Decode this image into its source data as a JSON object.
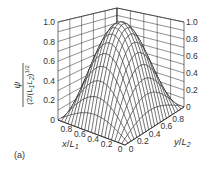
{
  "chart_data": {
    "type": "surface3d",
    "title": "",
    "panel_label": "(a)",
    "function": "psi / (2/(L1 L2))^(1/2) = sin(pi x/L1) * sin(pi y/L2)",
    "zlabel": {
      "main": "ψ",
      "den_prefix": "(2/(L",
      "den_s1": "1",
      "den_mid": "L",
      "den_s2": "2",
      "den_suffix": ")",
      "den_exp": "1/2"
    },
    "xlabel": {
      "var": "x",
      "slash": "/",
      "L": "L",
      "sub": "1"
    },
    "ylabel": {
      "var": "y",
      "slash": "/",
      "L": "L",
      "sub": "2"
    },
    "zlim": [
      0,
      1.0
    ],
    "xlim": [
      0,
      1
    ],
    "ylim": [
      0,
      1
    ],
    "z_ticks": [
      "0",
      "0.2",
      "0.4",
      "0.6",
      "0.8",
      "1.0"
    ],
    "x_ticks": [
      "0",
      "0.2",
      "0.4",
      "0.6",
      "0.8"
    ],
    "y_ticks": [
      "0",
      "0.2",
      "0.4",
      "0.6",
      "0.8"
    ],
    "grid_resolution": 20,
    "peak": {
      "x": 0.5,
      "y": 0.5,
      "z": 1.0
    },
    "sample_values": [
      {
        "x": 0.5,
        "y": 0.5,
        "z": 1.0
      },
      {
        "x": 0.25,
        "y": 0.5,
        "z": 0.707
      },
      {
        "x": 0.25,
        "y": 0.25,
        "z": 0.5
      },
      {
        "x": 0.0,
        "y": 0.5,
        "z": 0.0
      }
    ],
    "wall_grid": true,
    "line_color": "#1a1a1a",
    "wall_color": "#333333"
  }
}
